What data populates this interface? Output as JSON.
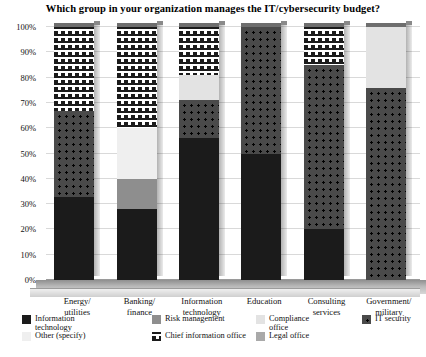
{
  "chart_data": {
    "type": "bar",
    "subtype": "100% stacked column (3D)",
    "title": "Which group in your organization manages the IT/cybersecurity budget?",
    "xlabel": "",
    "ylabel": "",
    "ylim": [
      0,
      100
    ],
    "ytick_labels": [
      "0%",
      "10%",
      "20%",
      "30%",
      "40%",
      "50%",
      "60%",
      "70%",
      "80%",
      "90%",
      "100%"
    ],
    "ytick_values": [
      0,
      10,
      20,
      30,
      40,
      50,
      60,
      70,
      80,
      90,
      100
    ],
    "grid": true,
    "legend_position": "bottom",
    "categories": [
      "Energy/\nutilities",
      "Banking/\nfinance",
      "Information\ntechnology",
      "Education",
      "Consulting\nservices",
      "Government/\nmilitary"
    ],
    "series": [
      {
        "name": "Information technology",
        "values": [
          33,
          28,
          56,
          50,
          20,
          0
        ]
      },
      {
        "name": "Risk management",
        "values": [
          0,
          12,
          0,
          0,
          0,
          0
        ]
      },
      {
        "name": "Compliance office",
        "values": [
          0,
          0,
          10,
          0,
          0,
          24
        ]
      },
      {
        "name": "IT security",
        "values": [
          34,
          0,
          15,
          50,
          65,
          76
        ]
      },
      {
        "name": "Other (specify)",
        "values": [
          0,
          20,
          0,
          0,
          0,
          0
        ]
      },
      {
        "name": "Chief information office",
        "values": [
          33,
          40,
          19,
          0,
          15,
          0
        ]
      },
      {
        "name": "Legal office",
        "values": [
          0,
          0,
          0,
          0,
          0,
          0
        ]
      }
    ]
  },
  "legend": {
    "items": [
      {
        "label": "Information\ntechnology",
        "swatch": "swatch-information-technology"
      },
      {
        "label": "Risk management",
        "swatch": "swatch-risk-management"
      },
      {
        "label": "Compliance\noffice",
        "swatch": "swatch-compliance-office"
      },
      {
        "label": "IT security",
        "swatch": "swatch-it-security"
      },
      {
        "label": "Other (specify)",
        "swatch": "swatch-other-specify"
      },
      {
        "label": "Chief information office",
        "swatch": "swatch-chief-information-office"
      },
      {
        "label": "Legal office",
        "swatch": "swatch-legal-office"
      }
    ]
  },
  "colors": {
    "information_technology": "#1b1b1b",
    "risk_management": "#8e8e8e",
    "compliance_office": "#e3e3e3",
    "it_security": "#4a4a4a",
    "other_specify": "#efefef",
    "chief_information_office": "#1b1b1b",
    "legal_office": "#a9a9a9",
    "gridline": "#d9d9d9",
    "background": "#ffffff",
    "text": "#111111"
  }
}
